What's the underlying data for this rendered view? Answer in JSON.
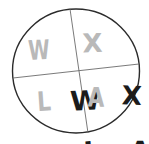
{
  "figure": {
    "shape": "circle",
    "stroke_color": "#2b2b2b",
    "divider_color": "#6b6b6b",
    "background_color": "#ffffff",
    "ink_color": "#1b1b1b",
    "ghost_ink_color": "#b9b9b9",
    "circle": {
      "center_x": 76,
      "center_y": 71,
      "radius": 63,
      "stroke_width": 1.4
    },
    "dividers": [
      {
        "name": "vertical-divider",
        "x1": 70,
        "y1": 9,
        "x2": 88,
        "y2": 133,
        "stroke_width": 0.9
      },
      {
        "name": "horizontal-divider",
        "x1": 13,
        "y1": 78,
        "x2": 139,
        "y2": 64,
        "stroke_width": 0.9
      }
    ]
  },
  "quadrants": {
    "top_left": {
      "label": "W",
      "ghost_label": "W",
      "position": "top-left"
    },
    "top_right": {
      "label": "X",
      "ghost_label": "X",
      "position": "top-right"
    },
    "bottom_left": {
      "label": "L",
      "ghost_label": "L",
      "position": "bottom-left"
    },
    "bottom_right": {
      "label": "A",
      "ghost_label": "A",
      "position": "bottom-right"
    }
  }
}
